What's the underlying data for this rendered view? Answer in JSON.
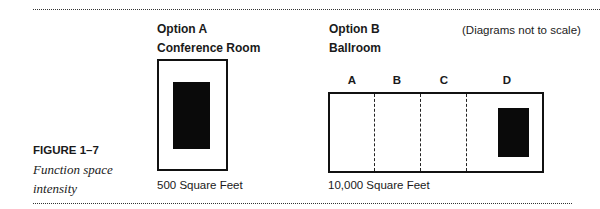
{
  "figure": {
    "label": "FIGURE 1–7",
    "caption_line1": "Function space",
    "caption_line2": "intensity"
  },
  "note": "(Diagrams not to scale)",
  "option_a": {
    "title": "Option A",
    "subtitle": "Conference Room",
    "area": "500 Square Feet"
  },
  "option_b": {
    "title": "Option B",
    "subtitle": "Ballroom",
    "area": "10,000 Square Feet",
    "sections": [
      "A",
      "B",
      "C",
      "D"
    ]
  }
}
